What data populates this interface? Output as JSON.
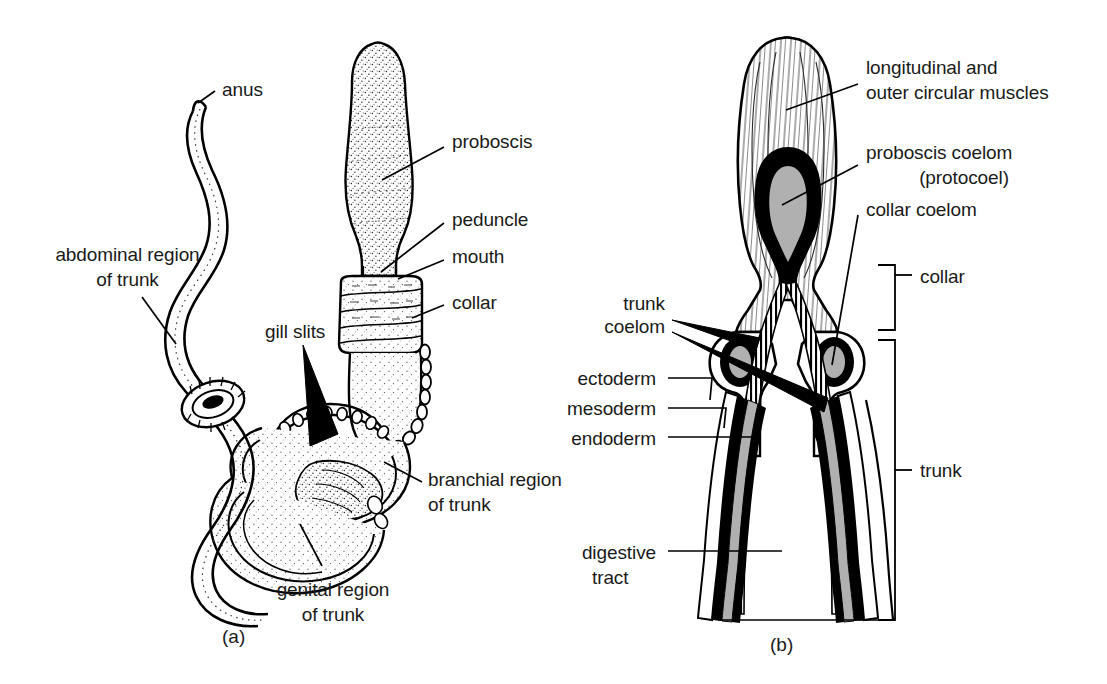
{
  "figure": {
    "kind": "anatomical-diagram",
    "background_color": "#ffffff",
    "ink_color": "#000000",
    "coelom_fill_color": "#b0b0b0"
  },
  "panels": [
    {
      "id": "a",
      "caption": "(a)",
      "labels": [
        {
          "name": "anus",
          "text": "anus"
        },
        {
          "name": "abdominal-region-of-trunk",
          "line1": "abdominal region",
          "line2": "of trunk"
        },
        {
          "name": "proboscis",
          "text": "proboscis"
        },
        {
          "name": "peduncle",
          "text": "peduncle"
        },
        {
          "name": "mouth",
          "text": "mouth"
        },
        {
          "name": "collar",
          "text": "collar"
        },
        {
          "name": "gill-slits",
          "text": "gill slits"
        },
        {
          "name": "branchial-region-of-trunk",
          "line1": "branchial region",
          "line2": "of trunk"
        },
        {
          "name": "genital-region-of-trunk",
          "line1": "genital region",
          "line2": "of trunk"
        }
      ]
    },
    {
      "id": "b",
      "caption": "(b)",
      "labels": [
        {
          "name": "longitudinal-and-outer-circular-muscles",
          "line1": "longitudinal and",
          "line2": "outer circular muscles"
        },
        {
          "name": "proboscis-coelom-protocoel",
          "line1": "proboscis coelom",
          "line2": "(protocoel)"
        },
        {
          "name": "collar-coelom",
          "text": "collar coelom"
        },
        {
          "name": "collar-bracket",
          "text": "collar"
        },
        {
          "name": "trunk-coelom",
          "line1": "trunk",
          "line2": "coelom"
        },
        {
          "name": "ectoderm",
          "text": "ectoderm"
        },
        {
          "name": "mesoderm",
          "text": "mesoderm"
        },
        {
          "name": "endoderm",
          "text": "endoderm"
        },
        {
          "name": "digestive-tract",
          "line1": "digestive",
          "line2": "tract"
        },
        {
          "name": "trunk-bracket",
          "text": "trunk"
        }
      ]
    }
  ],
  "text": {
    "a": {
      "anus": "anus",
      "abdominal_1": "abdominal region",
      "abdominal_2": "of trunk",
      "proboscis": "proboscis",
      "peduncle": "peduncle",
      "mouth": "mouth",
      "collar": "collar",
      "gill_slits": "gill slits",
      "branchial_1": "branchial region",
      "branchial_2": "of trunk",
      "genital_1": "genital region",
      "genital_2": "of trunk",
      "caption": "(a)"
    },
    "b": {
      "muscles_1": "longitudinal and",
      "muscles_2": "outer circular muscles",
      "protocoel_1": "proboscis coelom",
      "protocoel_2": "(protocoel)",
      "collar_coelom": "collar coelom",
      "collar_bracket": "collar",
      "trunk_coelom_1": "trunk",
      "trunk_coelom_2": "coelom",
      "ectoderm": "ectoderm",
      "mesoderm": "mesoderm",
      "endoderm": "endoderm",
      "digestive_1": "digestive",
      "digestive_2": "tract",
      "trunk_bracket": "trunk",
      "caption": "(b)"
    }
  }
}
